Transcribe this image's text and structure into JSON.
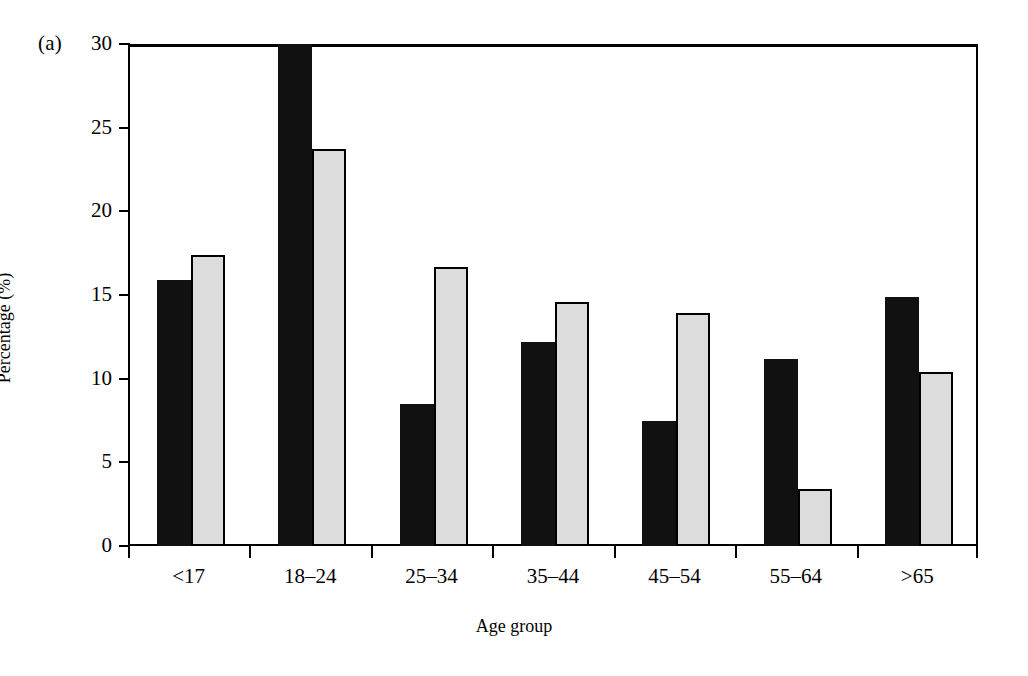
{
  "figure": {
    "panel_label": "(a)",
    "background_color": "#ffffff"
  },
  "chart_data": {
    "type": "bar",
    "title": "",
    "subtitle": "",
    "xlabel": "Age group",
    "ylabel": "Percentage (%)",
    "categories": [
      "<17",
      "18–24",
      "25–34",
      "35–44",
      "45–54",
      "55–64",
      ">65"
    ],
    "series": [
      {
        "name": "series-1",
        "color": "#111111",
        "style": "solid-black",
        "values": [
          15.9,
          30.0,
          8.5,
          12.2,
          7.5,
          11.2,
          14.9
        ],
        "notes": "Bar for 18–24 is clipped by the top of the axis (value exceeds 30)"
      },
      {
        "name": "series-2",
        "color": "#dcdcdc",
        "style": "light-gray-outlined",
        "values": [
          17.4,
          23.7,
          16.7,
          14.6,
          13.9,
          3.4,
          10.4
        ]
      }
    ],
    "ylim": [
      0,
      30
    ],
    "yticks": [
      0,
      5,
      10,
      15,
      20,
      25,
      30
    ],
    "ytick_labels": [
      "0",
      "5",
      "10",
      "15",
      "20",
      "25",
      "30"
    ],
    "grid": false,
    "legend": null,
    "legend_position": "none",
    "axis_frame": "box"
  }
}
